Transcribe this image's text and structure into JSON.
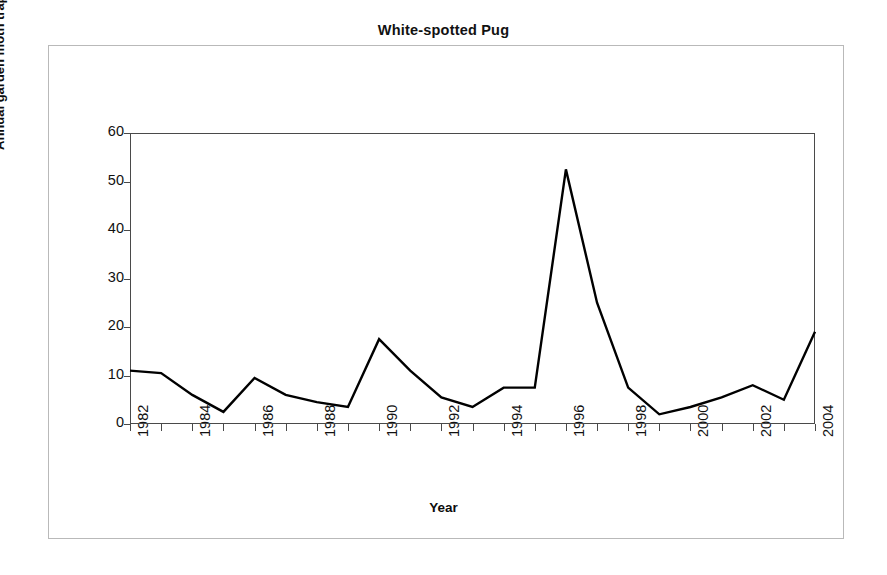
{
  "chart_data": {
    "type": "line",
    "title": "White-spotted Pug",
    "xlabel": "Year",
    "ylabel": "Annual garden moth trap total",
    "x": [
      1982,
      1983,
      1984,
      1985,
      1986,
      1987,
      1988,
      1989,
      1990,
      1991,
      1992,
      1993,
      1994,
      1995,
      1996,
      1997,
      1998,
      1999,
      2000,
      2001,
      2002,
      2003,
      2004
    ],
    "values": [
      11,
      10.5,
      6,
      2.5,
      9.5,
      6,
      4.5,
      3.5,
      17.5,
      11,
      5.5,
      3.5,
      7.5,
      7.5,
      52.5,
      25,
      7.5,
      2,
      3.5,
      5.5,
      8,
      5,
      19
    ],
    "series": [
      {
        "name": "Annual garden moth trap total",
        "values": [
          11,
          10.5,
          6,
          2.5,
          9.5,
          6,
          4.5,
          3.5,
          17.5,
          11,
          5.5,
          3.5,
          7.5,
          7.5,
          52.5,
          25,
          7.5,
          2,
          3.5,
          5.5,
          8,
          5,
          19
        ]
      }
    ],
    "xlim": [
      1982,
      2004
    ],
    "ylim": [
      0,
      60
    ],
    "ytick_labels": [
      "0",
      "10",
      "20",
      "30",
      "40",
      "50",
      "60"
    ],
    "ytick_values": [
      0,
      10,
      20,
      30,
      40,
      50,
      60
    ],
    "xtick_labels": [
      "1982",
      "1984",
      "1986",
      "1988",
      "1990",
      "1992",
      "1994",
      "1996",
      "1998",
      "2000",
      "2002",
      "2004"
    ],
    "xtick_values": [
      1982,
      1984,
      1986,
      1988,
      1990,
      1992,
      1994,
      1996,
      1998,
      2000,
      2002,
      2004
    ],
    "all_xtick_values": [
      1982,
      1983,
      1984,
      1985,
      1986,
      1987,
      1988,
      1989,
      1990,
      1991,
      1992,
      1993,
      1994,
      1995,
      1996,
      1997,
      1998,
      1999,
      2000,
      2001,
      2002,
      2003,
      2004
    ],
    "grid": false,
    "legend": "none",
    "line_color": "#000000",
    "line_width": 2.4,
    "axis_color": "#4a4a4a",
    "frame_color": "#b9b9b9",
    "background": "#ffffff"
  }
}
